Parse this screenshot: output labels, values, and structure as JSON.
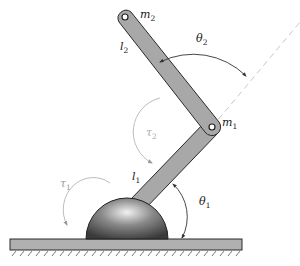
{
  "diagram": {
    "labels": {
      "m2": {
        "base": "m",
        "sub": "2"
      },
      "m1": {
        "base": "m",
        "sub": "1"
      },
      "l2": {
        "base": "l",
        "sub": "2"
      },
      "l1": {
        "base": "l",
        "sub": "1"
      },
      "theta2": {
        "base": "θ",
        "sub": "2"
      },
      "theta1": {
        "base": "θ",
        "sub": "1"
      },
      "tau2": {
        "base": "τ",
        "sub": "2"
      },
      "tau1": {
        "base": "τ",
        "sub": "1"
      }
    },
    "colors": {
      "link_fill": "#a8a8a8",
      "link_stroke": "#2a2a2a",
      "ground_fill": "#b0b0b0",
      "dome_light": "#e8e8e8",
      "dome_dark": "#3a3a3a",
      "dashed_line": "#c8c8c8",
      "torque_arc": "#bdbdbd",
      "angle_arc": "#333333"
    }
  }
}
